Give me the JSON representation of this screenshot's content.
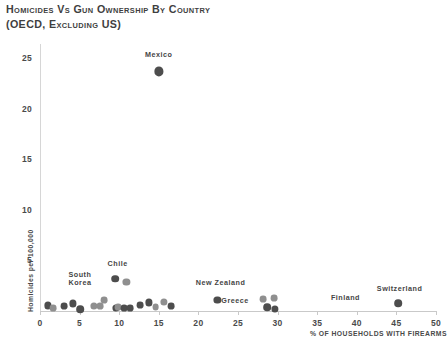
{
  "chart_data": {
    "type": "scatter",
    "title": "Homicides vs Gun Ownership by Country",
    "subtitle": "(OECD, excluding US)",
    "xlabel": "% of households with firearms",
    "ylabel": "Homicides per 100,000",
    "xlim": [
      0,
      50
    ],
    "ylim": [
      0,
      26.5
    ],
    "xticks": [
      0,
      5,
      10,
      15,
      20,
      25,
      30,
      35,
      40,
      45,
      50
    ],
    "yticks": [
      5,
      10,
      15,
      20,
      25
    ],
    "grid": false,
    "legend": "none",
    "point_color": "#4d4d4d",
    "point_color_light": "#8f8f8f",
    "points": [
      {
        "label": "Mexico",
        "x": 15.0,
        "y": 23.7,
        "r": 4.6,
        "shade": "dark"
      },
      {
        "label": "",
        "x": 9.5,
        "y": 3.2,
        "r": 3.8,
        "shade": "dark"
      },
      {
        "label": "",
        "x": 10.9,
        "y": 2.9,
        "r": 3.6,
        "shade": "light"
      },
      {
        "label": "",
        "x": 8.1,
        "y": 1.1,
        "r": 3.4,
        "shade": "light"
      },
      {
        "label": "",
        "x": 9.6,
        "y": 0.3,
        "r": 3.6,
        "shade": "dark"
      },
      {
        "label": "",
        "x": 1.0,
        "y": 0.55,
        "r": 3.6,
        "shade": "dark"
      },
      {
        "label": "",
        "x": 1.7,
        "y": 0.25,
        "r": 3.4,
        "shade": "light"
      },
      {
        "label": "",
        "x": 3.0,
        "y": 0.5,
        "r": 3.4,
        "shade": "dark"
      },
      {
        "label": "",
        "x": 4.2,
        "y": 0.75,
        "r": 3.6,
        "shade": "dark"
      },
      {
        "label": "",
        "x": 5.1,
        "y": 0.15,
        "r": 3.8,
        "shade": "dark"
      },
      {
        "label": "",
        "x": 6.8,
        "y": 0.5,
        "r": 3.6,
        "shade": "light"
      },
      {
        "label": "",
        "x": 7.6,
        "y": 0.45,
        "r": 3.4,
        "shade": "light"
      },
      {
        "label": "",
        "x": 9.9,
        "y": 0.35,
        "r": 3.4,
        "shade": "light"
      },
      {
        "label": "",
        "x": 10.6,
        "y": 0.3,
        "r": 3.4,
        "shade": "dark"
      },
      {
        "label": "",
        "x": 11.4,
        "y": 0.3,
        "r": 3.4,
        "shade": "dark"
      },
      {
        "label": "",
        "x": 12.6,
        "y": 0.55,
        "r": 3.4,
        "shade": "dark"
      },
      {
        "label": "",
        "x": 13.8,
        "y": 0.85,
        "r": 3.6,
        "shade": "dark"
      },
      {
        "label": "",
        "x": 14.6,
        "y": 0.35,
        "r": 3.4,
        "shade": "light"
      },
      {
        "label": "",
        "x": 15.6,
        "y": 0.9,
        "r": 3.6,
        "shade": "light"
      },
      {
        "label": "",
        "x": 16.6,
        "y": 0.5,
        "r": 3.4,
        "shade": "dark"
      },
      {
        "label": "New Zealand",
        "x": 22.4,
        "y": 1.1,
        "r": 3.6,
        "shade": "dark"
      },
      {
        "label": "",
        "x": 28.2,
        "y": 1.2,
        "r": 3.4,
        "shade": "light"
      },
      {
        "label": "",
        "x": 29.6,
        "y": 1.3,
        "r": 3.4,
        "shade": "light"
      },
      {
        "label": "",
        "x": 28.7,
        "y": 0.35,
        "r": 3.8,
        "shade": "dark"
      },
      {
        "label": "",
        "x": 29.7,
        "y": 0.2,
        "r": 3.6,
        "shade": "dark"
      },
      {
        "label": "Switzerland",
        "x": 45.2,
        "y": 0.75,
        "r": 3.8,
        "shade": "dark"
      }
    ],
    "annotations": [
      {
        "text": "Mexico",
        "x": 15.0,
        "y": 24.8,
        "align": "center"
      },
      {
        "text": "Chile",
        "x": 9.8,
        "y": 4.2,
        "align": "center"
      },
      {
        "text": "South\nKorea",
        "x": 3.6,
        "y": 3.1,
        "align": "left"
      },
      {
        "text": "New Zealand",
        "x": 22.8,
        "y": 2.3,
        "align": "center"
      },
      {
        "text": "Greece",
        "x": 22.9,
        "y": 0.45,
        "align": "left"
      },
      {
        "text": "Finland",
        "x": 40.4,
        "y": 0.75,
        "align": "right"
      },
      {
        "text": "Switzerland",
        "x": 45.4,
        "y": 1.7,
        "align": "center"
      }
    ]
  }
}
